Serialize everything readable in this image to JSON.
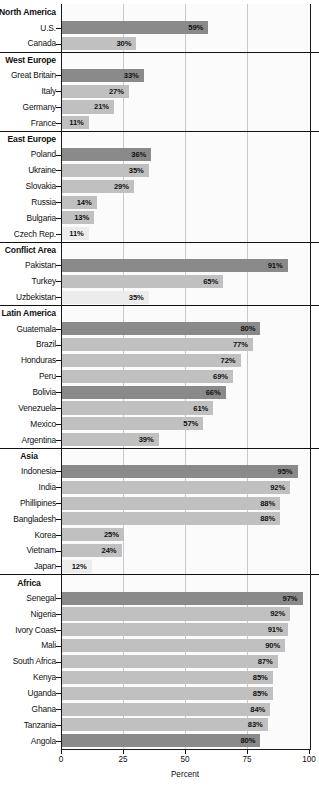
{
  "chart_data": {
    "type": "bar",
    "orientation": "horizontal",
    "title": "",
    "xlabel": "Percent",
    "ylabel": "",
    "xlim": [
      0,
      100
    ],
    "xticks": [
      "0",
      "25",
      "50",
      "75",
      "100"
    ],
    "grid": true,
    "legend": "none",
    "value_suffix": "%",
    "groups": [
      {
        "name": "North America",
        "label_align": "left",
        "items": [
          {
            "label": "U.S.",
            "value": 59,
            "value_label": "59%",
            "shade": "dark"
          },
          {
            "label": "Canada",
            "value": 30,
            "value_label": "30%",
            "shade": "light"
          }
        ]
      },
      {
        "name": "West Europe",
        "label_align": "left",
        "items": [
          {
            "label": "Great Britain",
            "value": 33,
            "value_label": "33%",
            "shade": "dark"
          },
          {
            "label": "Italy",
            "value": 27,
            "value_label": "27%",
            "shade": "light"
          },
          {
            "label": "Germany",
            "value": 21,
            "value_label": "21%",
            "shade": "light"
          },
          {
            "label": "France",
            "value": 11,
            "value_label": "11%",
            "shade": "light"
          }
        ]
      },
      {
        "name": "East Europe",
        "label_align": "left",
        "items": [
          {
            "label": "Poland",
            "value": 36,
            "value_label": "36%",
            "shade": "dark"
          },
          {
            "label": "Ukraine",
            "value": 35,
            "value_label": "35%",
            "shade": "light"
          },
          {
            "label": "Slovakia",
            "value": 29,
            "value_label": "29%",
            "shade": "light"
          },
          {
            "label": "Russia",
            "value": 14,
            "value_label": "14%",
            "shade": "light"
          },
          {
            "label": "Bulgaria",
            "value": 13,
            "value_label": "13%",
            "shade": "light"
          },
          {
            "label": "Czech Rep.",
            "value": 11,
            "value_label": "11%",
            "shade": "pale"
          }
        ]
      },
      {
        "name": "Conflict Area",
        "label_align": "left",
        "items": [
          {
            "label": "Pakistan",
            "value": 91,
            "value_label": "91%",
            "shade": "dark"
          },
          {
            "label": "Turkey",
            "value": 65,
            "value_label": "65%",
            "shade": "light"
          },
          {
            "label": "Uzbekistan",
            "value": 35,
            "value_label": "35%",
            "shade": "pale"
          }
        ]
      },
      {
        "name": "Latin America",
        "label_align": "left",
        "items": [
          {
            "label": "Guatemala",
            "value": 80,
            "value_label": "80%",
            "shade": "dark"
          },
          {
            "label": "Brazil",
            "value": 77,
            "value_label": "77%",
            "shade": "light"
          },
          {
            "label": "Honduras",
            "value": 72,
            "value_label": "72%",
            "shade": "light"
          },
          {
            "label": "Peru",
            "value": 69,
            "value_label": "69%",
            "shade": "light"
          },
          {
            "label": "Bolivia",
            "value": 66,
            "value_label": "66%",
            "shade": "dark"
          },
          {
            "label": "Venezuela",
            "value": 61,
            "value_label": "61%",
            "shade": "light"
          },
          {
            "label": "Mexico",
            "value": 57,
            "value_label": "57%",
            "shade": "light"
          },
          {
            "label": "Argentina",
            "value": 39,
            "value_label": "39%",
            "shade": "light"
          }
        ]
      },
      {
        "name": "Asia",
        "label_align": "center",
        "items": [
          {
            "label": "Indonesia",
            "value": 95,
            "value_label": "95%",
            "shade": "dark"
          },
          {
            "label": "India",
            "value": 92,
            "value_label": "92%",
            "shade": "light"
          },
          {
            "label": "Phillipines",
            "value": 88,
            "value_label": "88%",
            "shade": "light"
          },
          {
            "label": "Bangladesh",
            "value": 88,
            "value_label": "88%",
            "shade": "light"
          },
          {
            "label": "Korea",
            "value": 25,
            "value_label": "25%",
            "shade": "light"
          },
          {
            "label": "Vietnam",
            "value": 24,
            "value_label": "24%",
            "shade": "light"
          },
          {
            "label": "Japan",
            "value": 12,
            "value_label": "12%",
            "shade": "pale"
          }
        ]
      },
      {
        "name": "Africa",
        "label_align": "center",
        "items": [
          {
            "label": "Senegal",
            "value": 97,
            "value_label": "97%",
            "shade": "dark"
          },
          {
            "label": "Nigeria",
            "value": 92,
            "value_label": "92%",
            "shade": "light"
          },
          {
            "label": "Ivory Coast",
            "value": 91,
            "value_label": "91%",
            "shade": "light"
          },
          {
            "label": "Mali",
            "value": 90,
            "value_label": "90%",
            "shade": "light"
          },
          {
            "label": "South Africa",
            "value": 87,
            "value_label": "87%",
            "shade": "light"
          },
          {
            "label": "Kenya",
            "value": 85,
            "value_label": "85%",
            "shade": "light"
          },
          {
            "label": "Uganda",
            "value": 85,
            "value_label": "85%",
            "shade": "light"
          },
          {
            "label": "Ghana",
            "value": 84,
            "value_label": "84%",
            "shade": "light"
          },
          {
            "label": "Tanzania",
            "value": 83,
            "value_label": "83%",
            "shade": "light"
          },
          {
            "label": "Angola",
            "value": 80,
            "value_label": "80%",
            "shade": "dark"
          }
        ]
      }
    ]
  },
  "colors": {
    "bar_dark": "#8a8a8a",
    "bar_light": "#c0c0c0",
    "bar_pale": "#ececec",
    "axis": "#111111",
    "gridline": "#c9c9c9",
    "plot_background": "#fbfbfb"
  }
}
